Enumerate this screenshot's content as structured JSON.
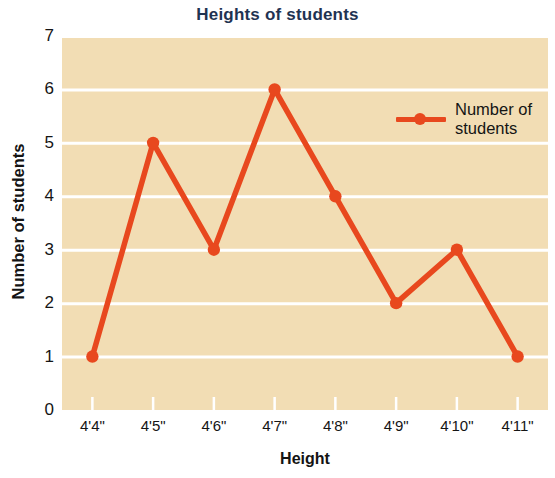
{
  "chart_data": {
    "type": "line",
    "title": "Heights of students",
    "xlabel": "Height",
    "ylabel": "Number of students",
    "categories": [
      "4'4\"",
      "4'5\"",
      "4'6\"",
      "4'7\"",
      "4'8\"",
      "4'9\"",
      "4'10\"",
      "4'11\""
    ],
    "series": [
      {
        "name": "Number of students",
        "values": [
          1,
          5,
          3,
          6,
          4,
          2,
          3,
          1
        ]
      }
    ],
    "ylim": [
      0,
      7
    ],
    "y_ticks": [
      0,
      1,
      2,
      3,
      4,
      5,
      6,
      7
    ],
    "y_tick_labels": [
      "0",
      "1",
      "2",
      "3",
      "4",
      "5",
      "6",
      "7"
    ],
    "grid": true,
    "grid_axis": "y",
    "legend_position": "upper-right-inside",
    "colors": {
      "series": "#e8481e",
      "plot_background": "#f2ddb4",
      "gridline": "#ffffff",
      "title": "#1f3352",
      "axis_text": "#151515",
      "page_background": "#ffffff"
    }
  },
  "legend": {
    "entries": [
      {
        "label_line1": "Number of",
        "label_line2": "students",
        "marker": "line-with-dot"
      }
    ]
  }
}
